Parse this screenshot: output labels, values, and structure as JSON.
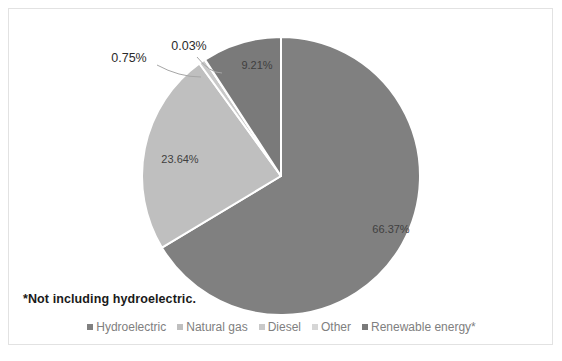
{
  "chart_data": {
    "type": "pie",
    "title": "",
    "subtitle": "",
    "xlabel": "",
    "ylabel": "",
    "legend_position": "bottom",
    "grid": false,
    "units": "percent",
    "categories": [
      "Hydroelectric",
      "Natural gas",
      "Diesel",
      "Other",
      "Renewable energy*"
    ],
    "values": [
      66.37,
      23.64,
      0.75,
      0.03,
      9.21
    ],
    "value_labels": [
      "66.37%",
      "23.64%",
      "0.75%",
      "0.03%",
      "9.21%"
    ],
    "colors": [
      "#808080",
      "#bfbfbf",
      "#c9c9c9",
      "#d6d6d6",
      "#7a7a7a"
    ],
    "start_angle_deg": 0,
    "direction": "clockwise",
    "slices": [
      {
        "name": "Hydroelectric",
        "value": 66.37,
        "label": "66.37%",
        "color": "#808080",
        "label_placement": "inside",
        "label_x": 382,
        "label_y": 221
      },
      {
        "name": "Natural gas",
        "value": 23.64,
        "label": "23.64%",
        "color": "#bfbfbf",
        "label_placement": "inside",
        "label_x": 171,
        "label_y": 151
      },
      {
        "name": "Diesel",
        "value": 0.75,
        "label": "0.75%",
        "color": "#c9c9c9",
        "label_placement": "callout",
        "label_x": 120,
        "label_y": 50
      },
      {
        "name": "Other",
        "value": 0.03,
        "label": "0.03%",
        "color": "#d6d6d6",
        "label_placement": "callout",
        "label_x": 180,
        "label_y": 38
      },
      {
        "name": "Renewable energy*",
        "value": 9.21,
        "label": "9.21%",
        "color": "#7a7a7a",
        "label_placement": "inside",
        "label_x": 248,
        "label_y": 57
      }
    ],
    "annotations": [
      "*Not including hydroelectric."
    ]
  },
  "footnote": {
    "text": "*Not including hydroelectric."
  },
  "legend": {
    "items": [
      {
        "label": "Hydroelectric",
        "color": "#808080"
      },
      {
        "label": "Natural gas",
        "color": "#bfbfbf"
      },
      {
        "label": "Diesel",
        "color": "#c9c9c9"
      },
      {
        "label": "Other",
        "color": "#d6d6d6"
      },
      {
        "label": "Renewable energy*",
        "color": "#7a7a7a"
      }
    ]
  },
  "style": {
    "background": "#ffffff",
    "border_color": "#e2e2e2",
    "slice_divider_color": "#ffffff",
    "label_color": "#3f3f3f",
    "legend_text_color": "#808080"
  }
}
